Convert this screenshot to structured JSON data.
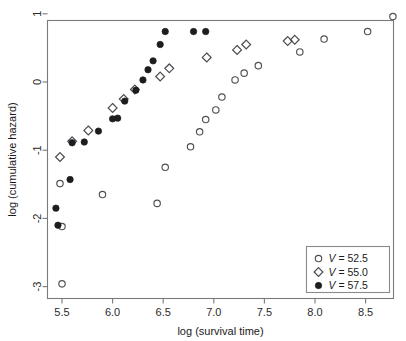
{
  "chart_data": {
    "type": "scatter",
    "title": "",
    "xlabel": "log (survival time)",
    "ylabel": "log (cumulative hazard)",
    "xlim": [
      5.35,
      8.8
    ],
    "ylim": [
      -3.12,
      1.18
    ],
    "xticks": [
      "5.5",
      "6.0",
      "6.5",
      "7.0",
      "7.5",
      "8.0",
      "8.5"
    ],
    "xtick_values": [
      5.5,
      6.0,
      6.5,
      7.0,
      7.5,
      8.0,
      8.5
    ],
    "yticks": [
      "1",
      "0",
      "-1",
      "-2",
      "-3"
    ],
    "ytick_values": [
      1,
      0,
      -1,
      -2,
      -3
    ],
    "grid": false,
    "legend_position": "bottom-right",
    "series": [
      {
        "name": "V = 52.5",
        "marker": "open-circle",
        "color": "#4f4f55",
        "points": [
          [
            5.5,
            -2.96
          ],
          [
            5.5,
            -2.12
          ],
          [
            5.48,
            -1.49
          ],
          [
            5.9,
            -1.65
          ],
          [
            6.44,
            -1.78
          ],
          [
            6.52,
            -1.25
          ],
          [
            6.77,
            -0.95
          ],
          [
            6.86,
            -0.73
          ],
          [
            6.92,
            -0.55
          ],
          [
            7.02,
            -0.41
          ],
          [
            7.08,
            -0.22
          ],
          [
            7.21,
            0.03
          ],
          [
            7.3,
            0.13
          ],
          [
            7.44,
            0.24
          ],
          [
            7.85,
            0.44
          ],
          [
            8.09,
            0.63
          ],
          [
            8.52,
            0.74
          ],
          [
            8.77,
            0.96
          ]
        ]
      },
      {
        "name": "V = 55.0",
        "marker": "open-diamond",
        "color": "#4a4a50",
        "points": [
          [
            5.48,
            -1.1
          ],
          [
            5.6,
            -0.87
          ],
          [
            5.76,
            -0.71
          ],
          [
            6.0,
            -0.38
          ],
          [
            6.11,
            -0.25
          ],
          [
            6.22,
            -0.11
          ],
          [
            6.47,
            0.08
          ],
          [
            6.56,
            0.2
          ],
          [
            6.93,
            0.36
          ],
          [
            7.23,
            0.47
          ],
          [
            7.32,
            0.55
          ],
          [
            7.73,
            0.6
          ],
          [
            7.8,
            0.62
          ]
        ]
      },
      {
        "name": "V = 57.5",
        "marker": "filled-circle",
        "color": "#1d1d1f",
        "points": [
          [
            5.44,
            -1.85
          ],
          [
            5.46,
            -2.1
          ],
          [
            5.58,
            -1.43
          ],
          [
            5.6,
            -0.89
          ],
          [
            5.72,
            -0.88
          ],
          [
            5.86,
            -0.72
          ],
          [
            6.0,
            -0.54
          ],
          [
            6.05,
            -0.53
          ],
          [
            6.12,
            -0.28
          ],
          [
            6.23,
            -0.12
          ],
          [
            6.3,
            0.03
          ],
          [
            6.35,
            0.18
          ],
          [
            6.4,
            0.31
          ],
          [
            6.47,
            0.55
          ],
          [
            6.52,
            0.74
          ],
          [
            6.8,
            0.74
          ],
          [
            6.92,
            0.74
          ]
        ]
      }
    ]
  },
  "legend": {
    "entries": [
      {
        "symbol": "open-circle",
        "var": "V",
        "eq": " = ",
        "value": "52.5"
      },
      {
        "symbol": "open-diamond",
        "var": "V",
        "eq": " = ",
        "value": "55.0"
      },
      {
        "symbol": "filled-circle",
        "var": "V",
        "eq": " = ",
        "value": "57.5"
      }
    ]
  }
}
